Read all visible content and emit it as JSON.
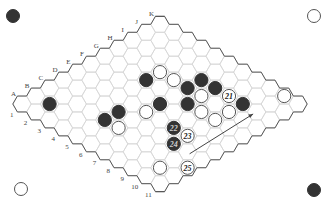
{
  "game": "Hex",
  "board_size": 11,
  "colors": {
    "black_stone": "#333333",
    "white_stone": "#ffffff",
    "white_stone_stroke": "#555555",
    "grid_line": "#d6d6d6",
    "border_line": "#555555",
    "label": "#444444",
    "arrow": "#444444"
  },
  "column_labels": [
    "A",
    "B",
    "C",
    "D",
    "E",
    "F",
    "G",
    "H",
    "I",
    "J",
    "K"
  ],
  "row_labels": [
    "1",
    "2",
    "3",
    "4",
    "5",
    "6",
    "7",
    "8",
    "9",
    "10",
    "11"
  ],
  "corner_markers": [
    {
      "position": "top-left",
      "color": "black"
    },
    {
      "position": "top-right",
      "color": "white"
    },
    {
      "position": "bottom-left",
      "color": "white"
    },
    {
      "position": "bottom-right",
      "color": "black"
    }
  ],
  "stones": [
    {
      "cell": "B2",
      "col": 1,
      "row": 1,
      "color": "black",
      "label": ""
    },
    {
      "cell": "C5",
      "col": 2,
      "row": 4,
      "color": "black",
      "label": ""
    },
    {
      "cell": "D5",
      "col": 3,
      "row": 4,
      "color": "black",
      "label": ""
    },
    {
      "cell": "C6",
      "col": 2,
      "row": 5,
      "color": "white",
      "label": ""
    },
    {
      "cell": "G4",
      "col": 6,
      "row": 3,
      "color": "black",
      "label": ""
    },
    {
      "cell": "H4",
      "col": 7,
      "row": 3,
      "color": "white",
      "label": ""
    },
    {
      "cell": "H5",
      "col": 7,
      "row": 4,
      "color": "white",
      "label": ""
    },
    {
      "cell": "E6",
      "col": 4,
      "row": 5,
      "color": "white",
      "label": ""
    },
    {
      "cell": "F6",
      "col": 5,
      "row": 5,
      "color": "black",
      "label": ""
    },
    {
      "cell": "H6",
      "col": 7,
      "row": 5,
      "color": "black",
      "label": ""
    },
    {
      "cell": "I6",
      "col": 8,
      "row": 5,
      "color": "black",
      "label": ""
    },
    {
      "cell": "I7",
      "col": 8,
      "row": 6,
      "color": "black",
      "label": ""
    },
    {
      "cell": "H7",
      "col": 7,
      "row": 6,
      "color": "white",
      "label": ""
    },
    {
      "cell": "G7",
      "col": 6,
      "row": 6,
      "color": "black",
      "label": ""
    },
    {
      "cell": "G8",
      "col": 6,
      "row": 7,
      "color": "white",
      "label": ""
    },
    {
      "cell": "G9",
      "col": 6,
      "row": 8,
      "color": "white",
      "label": ""
    },
    {
      "cell": "H9",
      "col": 7,
      "row": 8,
      "color": "white",
      "label": ""
    },
    {
      "cell": "I8",
      "col": 8,
      "row": 7,
      "color": "white",
      "label": "21"
    },
    {
      "cell": "I9",
      "col": 8,
      "row": 8,
      "color": "black",
      "label": ""
    },
    {
      "cell": "E8",
      "col": 4,
      "row": 7,
      "color": "black",
      "label": "22"
    },
    {
      "cell": "E9",
      "col": 4,
      "row": 8,
      "color": "white",
      "label": "23"
    },
    {
      "cell": "D9",
      "col": 3,
      "row": 8,
      "color": "black",
      "label": "24"
    },
    {
      "cell": "B11",
      "col": 1,
      "row": 9,
      "color": "white",
      "label": ""
    },
    {
      "cell": "C11",
      "col": 2,
      "row": 10,
      "color": "white",
      "label": "25"
    },
    {
      "cell": "K11",
      "col": 10,
      "row": 9,
      "color": "white",
      "label": ""
    }
  ],
  "arrow": {
    "from": "D10",
    "to": "I10",
    "description": "threat direction"
  }
}
